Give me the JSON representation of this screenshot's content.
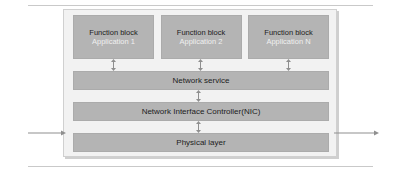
{
  "diagram": {
    "colors": {
      "block_fill": "#b4b4b4",
      "block_border": "#ababab",
      "frame_fill": "#f2f2f2",
      "frame_border": "#d0d0d0",
      "text_dark": "#1c1c1c",
      "text_light": "#f0f0f0",
      "arrow": "#8f8f8f",
      "rule": "#c9c9c9"
    },
    "function_blocks": [
      {
        "title": "Function block",
        "subtitle": "Application 1"
      },
      {
        "title": "Function block",
        "subtitle": "Application 2"
      },
      {
        "title": "Function block",
        "subtitle": "Application N"
      }
    ],
    "layers": [
      {
        "label": "Network service"
      },
      {
        "label": "Network Interface Controller(NIC)"
      },
      {
        "label": "Physical layer"
      }
    ],
    "connectors": {
      "app_to_service": "double-headed-vertical-arrow",
      "service_to_nic": "double-headed-vertical-arrow",
      "nic_to_physical": "double-headed-vertical-arrow",
      "external_left": "arrow-right-into-physical-layer",
      "external_right": "arrow-right-out-of-physical-layer"
    }
  }
}
